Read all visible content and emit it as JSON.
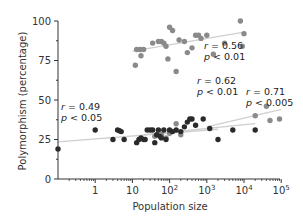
{
  "chart_data": {
    "type": "scatter",
    "title": "",
    "xlabel": "Population size",
    "ylabel": "Polymorphism (percentage)",
    "xscale": "log",
    "xlim": [
      0.1,
      100000
    ],
    "ylim": [
      0,
      100
    ],
    "x_ticks": [
      1,
      10,
      100,
      1000,
      10000,
      100000
    ],
    "x_tick_labels": [
      "1",
      "10",
      "10^2",
      "10^3",
      "10^4",
      "10^5"
    ],
    "y_ticks": [
      0,
      25,
      50,
      75,
      100
    ],
    "y_tick_labels": [
      "0",
      "25",
      "50",
      "75",
      "100"
    ],
    "grid": false,
    "legend": null,
    "series": [
      {
        "name": "black",
        "color": "#2a2a2a",
        "regression": {
          "r": 0.49,
          "p": "< 0.05",
          "x_range": [
            0.1,
            2000
          ],
          "y_range": [
            23.5,
            31.5
          ]
        },
        "points": [
          [
            0.1,
            19
          ],
          [
            1,
            31
          ],
          [
            3,
            25
          ],
          [
            4,
            31
          ],
          [
            4.5,
            30.5
          ],
          [
            5,
            30
          ],
          [
            6,
            25
          ],
          [
            13,
            23
          ],
          [
            15,
            25
          ],
          [
            17,
            26
          ],
          [
            20,
            25
          ],
          [
            22,
            25
          ],
          [
            25,
            31
          ],
          [
            30,
            31
          ],
          [
            35,
            31
          ],
          [
            40,
            23
          ],
          [
            45,
            28
          ],
          [
            50,
            31
          ],
          [
            55,
            27
          ],
          [
            60,
            26
          ],
          [
            70,
            31
          ],
          [
            80,
            25
          ],
          [
            100,
            31
          ],
          [
            120,
            30
          ],
          [
            150,
            31
          ],
          [
            200,
            30
          ],
          [
            250,
            33
          ],
          [
            300,
            36
          ],
          [
            350,
            38
          ],
          [
            400,
            38
          ],
          [
            500,
            34
          ],
          [
            800,
            38
          ],
          [
            1200,
            32
          ],
          [
            2000,
            25
          ],
          [
            5000,
            31
          ],
          [
            20000,
            31
          ]
        ]
      },
      {
        "name": "grey-mid",
        "color": "#8a8a8a",
        "regression": {
          "r": 0.62,
          "p": "< 0.01",
          "x_range": [
            20,
            20000
          ],
          "y_range": [
            28,
            35
          ]
        },
        "points": [
          [
            40,
            27
          ],
          [
            60,
            28
          ],
          [
            80,
            26
          ],
          [
            100,
            29
          ],
          [
            150,
            35
          ],
          [
            200,
            28
          ]
        ]
      },
      {
        "name": "grey-right",
        "color": "#8a8a8a",
        "regression": {
          "r": 0.71,
          "p": "< 0.005",
          "x_range": [
            1000,
            100000
          ],
          "y_range": [
            33,
            44
          ]
        },
        "points": [
          [
            20000,
            40
          ],
          [
            40000,
            46
          ],
          [
            50000,
            37
          ],
          [
            90000,
            38
          ]
        ]
      },
      {
        "name": "grey-top",
        "color": "#8a8a8a",
        "regression": {
          "r": 0.56,
          "p": "< 0.01",
          "x_range": [
            10,
            10000
          ],
          "y_range": [
            81,
            93
          ]
        },
        "points": [
          [
            12,
            72
          ],
          [
            13,
            82
          ],
          [
            16,
            82
          ],
          [
            17,
            78
          ],
          [
            20,
            82
          ],
          [
            35,
            86
          ],
          [
            50,
            87
          ],
          [
            60,
            87
          ],
          [
            70,
            86
          ],
          [
            80,
            84
          ],
          [
            90,
            76
          ],
          [
            100,
            96
          ],
          [
            120,
            94
          ],
          [
            150,
            68
          ],
          [
            180,
            88
          ],
          [
            250,
            87
          ],
          [
            300,
            80
          ],
          [
            400,
            83
          ],
          [
            500,
            91
          ],
          [
            600,
            91
          ],
          [
            700,
            89
          ],
          [
            1000,
            91
          ],
          [
            1500,
            79
          ],
          [
            3000,
            86
          ],
          [
            8000,
            100
          ],
          [
            9000,
            84
          ],
          [
            10000,
            92
          ]
        ]
      }
    ],
    "annotations": [
      {
        "text_r": "r = 0.49",
        "text_p": "p < 0.05",
        "x": 0.12,
        "y": 43
      },
      {
        "text_r": "r = 0.62",
        "text_p": "p < 0.01",
        "x": 250,
        "y": 52
      },
      {
        "text_r": "r = 0.71",
        "text_p": "p < 0.005",
        "x": 7000,
        "y": 51
      },
      {
        "text_r": "r = 0.56",
        "text_p": "p < 0.01",
        "x": 1800,
        "y": 82
      }
    ]
  },
  "axes": {
    "xlabel": "Population size",
    "ylabel": "Polymorphism (percentage)",
    "y_tick_labels": [
      "0",
      "25",
      "50",
      "75",
      "100"
    ],
    "x_tick_labels": [
      {
        "base": "1",
        "exp": ""
      },
      {
        "base": "10",
        "exp": ""
      },
      {
        "base": "10",
        "exp": "2"
      },
      {
        "base": "10",
        "exp": "3"
      },
      {
        "base": "10",
        "exp": "4"
      },
      {
        "base": "10",
        "exp": "5"
      }
    ]
  },
  "annotations_text": {
    "a1_r": "r = 0.49",
    "a1_p": "p < 0.05",
    "a2_r": "r = 0.62",
    "a2_p": "p < 0.01",
    "a3_r": "r = 0.71",
    "a3_p": "p < 0.005",
    "a4_r": "r = 0.56",
    "a4_p": "p < 0.01"
  }
}
